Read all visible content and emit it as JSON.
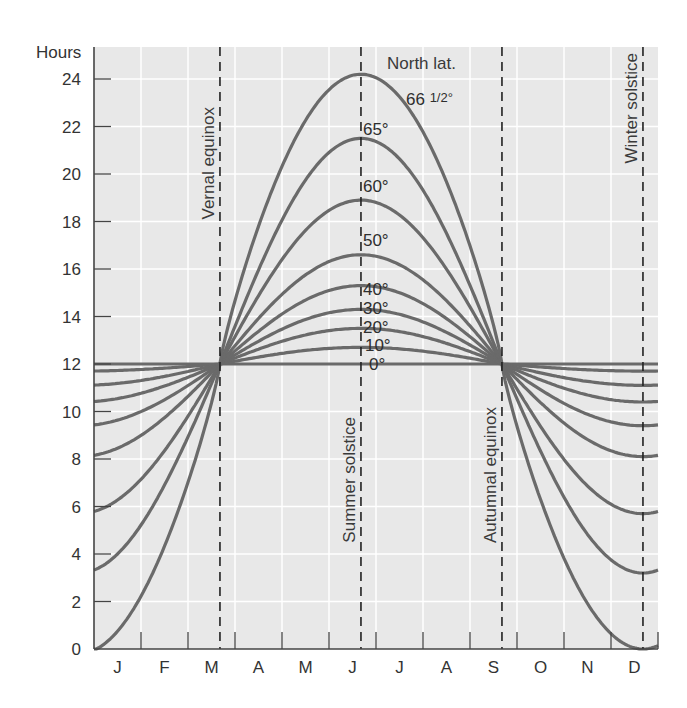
{
  "chart_data": {
    "type": "line",
    "title": "",
    "ylabel": "Hours",
    "xlabel": "",
    "ylim": [
      0,
      24
    ],
    "yticks": [
      0,
      2,
      4,
      6,
      8,
      10,
      12,
      14,
      16,
      18,
      20,
      22,
      24
    ],
    "months": [
      "J",
      "F",
      "M",
      "A",
      "M",
      "J",
      "J",
      "A",
      "S",
      "O",
      "N",
      "D"
    ],
    "grid": true,
    "legend_title": "North lat.",
    "events": [
      {
        "name": "Vernal equinox",
        "month_pos": 2.68
      },
      {
        "name": "Summer solstice",
        "month_pos": 5.68
      },
      {
        "name": "Autumnal equinox",
        "month_pos": 8.68
      },
      {
        "name": "Winter solstice",
        "month_pos": 11.68
      }
    ],
    "series": [
      {
        "name": "0°",
        "label": "0°",
        "jan": 12.0,
        "max": 12.0,
        "dec_min": 12.0
      },
      {
        "name": "10°",
        "label": "10°",
        "jan": 11.3,
        "max": 12.7,
        "dec_min": 11.7
      },
      {
        "name": "20°",
        "label": "20°",
        "jan": 10.7,
        "max": 13.5,
        "dec_min": 11.1
      },
      {
        "name": "30°",
        "label": "30°",
        "jan": 9.9,
        "max": 14.3,
        "dec_min": 10.4
      },
      {
        "name": "40°",
        "label": "40°",
        "jan": 8.8,
        "max": 15.3,
        "dec_min": 9.4
      },
      {
        "name": "50°",
        "label": "50°",
        "jan": 7.7,
        "max": 16.6,
        "dec_min": 8.1
      },
      {
        "name": "60°",
        "label": "60°",
        "jan": 5.1,
        "max": 18.9,
        "dec_min": 5.7
      },
      {
        "name": "65°",
        "label": "65°",
        "jan": 2.9,
        "max": 21.5,
        "dec_min": 3.2
      },
      {
        "name": "66 1/2°",
        "label": "66 1/2°",
        "jan": 0.0,
        "max": 24.2,
        "dec_min": 0.1
      }
    ]
  },
  "labels": {
    "hours": "Hours",
    "north_lat": "North lat.",
    "lat_66_main": "66",
    "lat_66_frac": "1/2°"
  },
  "colors": {
    "plot_bg": "#e8e8e8",
    "grid": "#ffffff",
    "curve": "#6a6a6a",
    "axis": "#444444",
    "dashed": "#222222"
  }
}
